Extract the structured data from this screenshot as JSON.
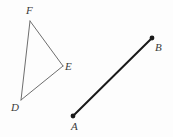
{
  "figure": {
    "background_color": "#fdfdfd",
    "width": 173,
    "height": 137,
    "triangle": {
      "name": "triangle-DEF",
      "stroke_color": "#6e6e6e",
      "stroke_width": 1,
      "fill": "none",
      "vertices": [
        {
          "label": "F",
          "x": 30,
          "y": 21
        },
        {
          "label": "E",
          "x": 63,
          "y": 66
        },
        {
          "label": "D",
          "x": 21,
          "y": 100
        }
      ],
      "edges": [
        {
          "from": "F",
          "to": "E"
        },
        {
          "from": "E",
          "to": "D"
        },
        {
          "from": "D",
          "to": "F"
        }
      ]
    },
    "segment": {
      "name": "segment-AB",
      "stroke_color": "#1a1a1a",
      "stroke_width": 2,
      "endpoint_dot_radius": 2.4,
      "endpoints": [
        {
          "label": "A",
          "x": 73,
          "y": 116
        },
        {
          "label": "B",
          "x": 152,
          "y": 38
        }
      ]
    },
    "labels": {
      "F": "F",
      "E": "E",
      "D": "D",
      "A": "A",
      "B": "B"
    }
  }
}
